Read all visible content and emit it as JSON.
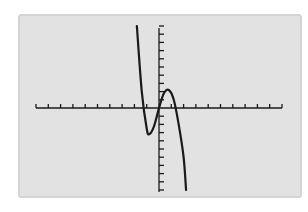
{
  "chart_data": {
    "type": "line",
    "title": "",
    "xlabel": "",
    "ylabel": "",
    "grid": false,
    "legend": null,
    "x_axis": {
      "ticks_left_of_origin": 10,
      "ticks_right_of_origin": 10
    },
    "y_axis": {
      "ticks_above_origin": 10,
      "ticks_below_origin": 10
    },
    "xlim": [
      -10,
      10
    ],
    "ylim": [
      -10,
      10
    ],
    "series": [
      {
        "name": "f(x)",
        "shape": "cubic, rising from +inf on left, local min then local max, falling to -inf on right",
        "points": [
          {
            "x": -1.8,
            "y": 10
          },
          {
            "x": -1.4,
            "y": 2
          },
          {
            "x": -1.0,
            "y": -2.5
          },
          {
            "x": -0.8,
            "y": -3.2
          },
          {
            "x": -0.4,
            "y": -2.2
          },
          {
            "x": 0.0,
            "y": 0.0
          },
          {
            "x": 0.4,
            "y": 1.8
          },
          {
            "x": 0.8,
            "y": 2.2
          },
          {
            "x": 1.2,
            "y": 1.0
          },
          {
            "x": 1.6,
            "y": -2.0
          },
          {
            "x": 2.0,
            "y": -6.0
          },
          {
            "x": 2.2,
            "y": -10
          }
        ]
      }
    ]
  },
  "colors": {
    "screen_bg": "#e2e2e2",
    "ink": "#1a1a1a"
  }
}
